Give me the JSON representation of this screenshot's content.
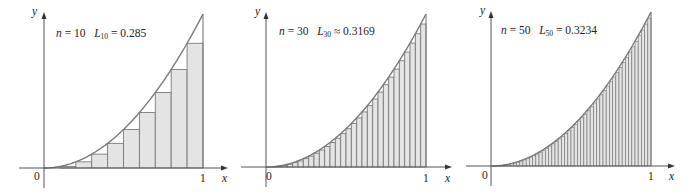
{
  "figure": {
    "function": "x^2",
    "fill_color": "#e4e4e4",
    "edge_color": "#7a7a7a",
    "axis_color": "#555555"
  },
  "chart_data": [
    {
      "type": "area",
      "title": "n = 10   L10 = 0.285",
      "n": 10,
      "L_label": "L",
      "L_sub": "10",
      "n_value": "10",
      "relation": "=",
      "L_value": "0.285",
      "xlabel": "x",
      "ylabel": "y",
      "x_ticks": [
        "0",
        "1"
      ],
      "xlim": [
        0,
        1
      ],
      "ylim": [
        0,
        1
      ],
      "curve": "y = x^2",
      "rect_heights": [
        0,
        0.01,
        0.04,
        0.09,
        0.16,
        0.25,
        0.36,
        0.49,
        0.64,
        0.81
      ]
    },
    {
      "type": "area",
      "title": "n = 30   L30 ≈ 0.3169",
      "n": 30,
      "L_label": "L",
      "L_sub": "30",
      "n_value": "30",
      "relation": "≈",
      "L_value": "0.3169",
      "xlabel": "x",
      "ylabel": "y",
      "x_ticks": [
        "0",
        "1"
      ],
      "xlim": [
        0,
        1
      ],
      "ylim": [
        0,
        1
      ],
      "curve": "y = x^2"
    },
    {
      "type": "area",
      "title": "n = 50   L50 = 0.3234",
      "n": 50,
      "L_label": "L",
      "L_sub": "50",
      "n_value": "50",
      "relation": "=",
      "L_value": "0.3234",
      "xlabel": "x",
      "ylabel": "y",
      "x_ticks": [
        "0",
        "1"
      ],
      "xlim": [
        0,
        1
      ],
      "ylim": [
        0,
        1
      ],
      "curve": "y = x^2"
    }
  ],
  "panels": [
    {
      "ox": 44,
      "oy": 168,
      "x1": 203,
      "ytop": 14,
      "axis_top": 12,
      "axis_right": 228,
      "text_x": 56,
      "text_y": 27
    },
    {
      "ox": 266,
      "oy": 167,
      "x1": 426,
      "ytop": 14,
      "axis_top": 12,
      "axis_right": 452,
      "text_x": 279,
      "text_y": 25
    },
    {
      "ox": 491,
      "oy": 166,
      "x1": 651,
      "ytop": 12,
      "axis_top": 11,
      "axis_right": 675,
      "text_x": 501,
      "text_y": 24
    }
  ]
}
